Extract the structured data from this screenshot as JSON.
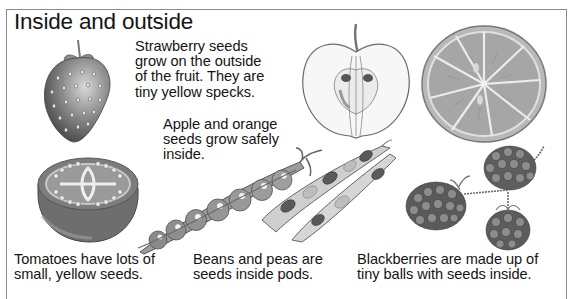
{
  "page": {
    "title": "Inside and outside"
  },
  "captions": {
    "strawberry": {
      "lines": [
        "Strawberry seeds",
        "grow on the outside",
        "of the fruit. They are",
        "tiny yellow specks."
      ]
    },
    "apple_orange": {
      "lines": [
        "Apple and orange",
        "seeds grow safely",
        "inside."
      ]
    },
    "tomato": {
      "lines": [
        "Tomatoes have lots of",
        "small, yellow seeds."
      ]
    },
    "beans_peas": {
      "lines": [
        "Beans and peas are",
        "seeds inside pods."
      ]
    },
    "blackberries": {
      "lines": [
        "Blackberries are made up of",
        "tiny balls with seeds inside."
      ]
    }
  },
  "illustrations": [
    {
      "name": "strawberry",
      "icon": "strawberry-illustration"
    },
    {
      "name": "apple-half",
      "icon": "apple-cross-section-illustration"
    },
    {
      "name": "orange-slice",
      "icon": "orange-cross-section-illustration"
    },
    {
      "name": "tomato-half",
      "icon": "tomato-cross-section-illustration"
    },
    {
      "name": "pea-pod",
      "icon": "pea-pod-illustration"
    },
    {
      "name": "bean-pod",
      "icon": "bean-pod-illustration"
    },
    {
      "name": "blackberries",
      "icon": "blackberries-illustration"
    }
  ],
  "colors": {
    "frame": "#8a8a8a",
    "text": "#141414",
    "background": "#ffffff"
  }
}
